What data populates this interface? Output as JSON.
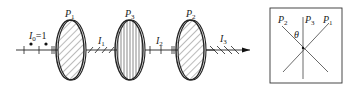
{
  "diagram": {
    "beam": {
      "input_label": "I",
      "input_sub": "0",
      "input_value": "=1",
      "segments": [
        {
          "label": "I",
          "sub": "1"
        },
        {
          "label": "I",
          "sub": "2"
        },
        {
          "label": "I",
          "sub": "3"
        }
      ]
    },
    "polarizers": [
      {
        "label": "P",
        "sub": "1",
        "hatch": "diagonal"
      },
      {
        "label": "P",
        "sub": "3",
        "hatch": "vertical"
      },
      {
        "label": "P",
        "sub": "2",
        "hatch": "diagonal"
      }
    ],
    "inset": {
      "axes": [
        {
          "label": "P",
          "sub": "2"
        },
        {
          "label": "P",
          "sub": "3"
        },
        {
          "label": "P",
          "sub": "1"
        }
      ],
      "angle_label": "θ"
    }
  },
  "colors": {
    "line": "#222222",
    "hatch": "#555555",
    "background": "#ffffff"
  }
}
